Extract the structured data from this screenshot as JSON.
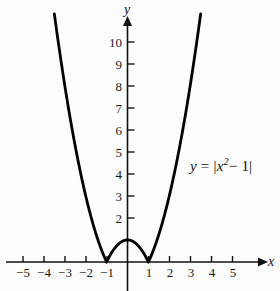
{
  "figure": {
    "background_color": "#fdfdfd",
    "ink_color": "#111111",
    "curve_color": "#000000"
  },
  "axes": {
    "x_axis_name": "x",
    "y_axis_name": "y",
    "x_ticks": [
      "−5",
      "−4",
      "−3",
      "−2",
      "−1",
      "1",
      "2",
      "3",
      "4",
      "5"
    ],
    "y_ticks": [
      "2",
      "3",
      "4",
      "5",
      "6",
      "7",
      "8",
      "9",
      "10"
    ]
  },
  "annotations": {
    "equation_y": "y",
    "equation_equals": "=",
    "equation_open_bar": "|",
    "equation_base": "x",
    "equation_exponent": "2",
    "equation_minus_one": "− 1",
    "equation_close_bar": "|",
    "equation_plain": "y = |x² − 1|"
  },
  "chart_data": {
    "type": "line",
    "title": "",
    "subtitle": "",
    "xlabel": "x",
    "ylabel": "y",
    "legend": [
      "y = |x² − 1|"
    ],
    "legend_position": "inside-right",
    "grid": false,
    "xlim": [
      -5.6,
      5.6
    ],
    "ylim": [
      0,
      11.2
    ],
    "xticks": [
      -5,
      -4,
      -3,
      -2,
      -1,
      1,
      2,
      3,
      4,
      5
    ],
    "yticks": [
      2,
      3,
      4,
      5,
      6,
      7,
      8,
      9,
      10
    ],
    "origin_label_hidden": true,
    "axis_arrows": [
      "x-positive",
      "y-positive"
    ],
    "series": [
      {
        "name": "y = |x² − 1|",
        "formula": "abs(x^2 - 1)",
        "x_domain": [
          -3.5,
          3.5
        ],
        "x": [
          -3.5,
          -3.25,
          -3.0,
          -2.75,
          -2.5,
          -2.25,
          -2.0,
          -1.75,
          -1.5,
          -1.25,
          -1.0,
          -0.75,
          -0.5,
          -0.25,
          0.0,
          0.25,
          0.5,
          0.75,
          1.0,
          1.25,
          1.5,
          1.75,
          2.0,
          2.25,
          2.5,
          2.75,
          3.0,
          3.25,
          3.5
        ],
        "y": [
          11.25,
          9.5625,
          8.0,
          6.5625,
          5.25,
          4.0625,
          3.0,
          2.0625,
          1.25,
          0.5625,
          0.0,
          0.4375,
          0.75,
          0.9375,
          1.0,
          0.9375,
          0.75,
          0.4375,
          0.0,
          0.5625,
          1.25,
          2.0625,
          3.0,
          4.0625,
          5.25,
          6.5625,
          8.0,
          9.5625,
          11.25
        ],
        "key_points": [
          {
            "x": -1,
            "y": 0,
            "note": "cusp / zero"
          },
          {
            "x": 0,
            "y": 1,
            "note": "local maximum of hump"
          },
          {
            "x": 1,
            "y": 0,
            "note": "cusp / zero"
          }
        ]
      }
    ]
  }
}
